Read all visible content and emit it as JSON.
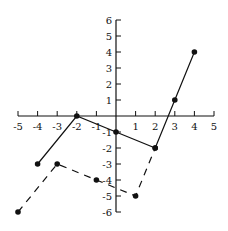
{
  "chart_data": {
    "type": "line",
    "title": "",
    "xlabel": "",
    "ylabel": "",
    "xlim": [
      -5,
      5
    ],
    "ylim": [
      -6,
      6
    ],
    "grid": false,
    "legend": null,
    "x_ticks": [
      -5,
      -4,
      -3,
      -2,
      -1,
      1,
      2,
      3,
      4,
      5
    ],
    "y_ticks": [
      6,
      5,
      4,
      3,
      2,
      1,
      -1,
      -2,
      -3,
      -4,
      -5,
      -6
    ],
    "series": [
      {
        "name": "solid",
        "style": "solid",
        "points": [
          [
            -4,
            -3
          ],
          [
            -2,
            0
          ],
          [
            0,
            -1
          ],
          [
            2,
            -2
          ],
          [
            3,
            1
          ],
          [
            4,
            4
          ]
        ]
      },
      {
        "name": "dashed",
        "style": "dashed",
        "points": [
          [
            -5,
            -6
          ],
          [
            -3,
            -3
          ],
          [
            -1,
            -4
          ],
          [
            1,
            -5
          ],
          [
            2,
            -2
          ]
        ]
      }
    ],
    "colors": {
      "line": "#111111",
      "axis": "#111111"
    }
  }
}
